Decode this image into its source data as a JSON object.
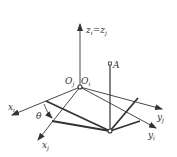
{
  "diagram": {
    "type": "coordinate-frame-rotation",
    "labels": {
      "z_axis": "z",
      "z_sub_i": "i",
      "z_eq": "=",
      "z_sub_j": "j",
      "origin_j": "O",
      "origin_j_sub": "j",
      "origin_i": "O",
      "origin_i_sub": "i",
      "point_a": "A",
      "x_i": "x",
      "x_i_sub": "i",
      "x_j": "x",
      "x_j_sub": "j",
      "y_j": "y",
      "y_j_sub": "j",
      "y_i": "y",
      "y_i_sub": "i",
      "theta": "θ"
    },
    "colors": {
      "line": "#333333",
      "background": "#ffffff"
    }
  }
}
